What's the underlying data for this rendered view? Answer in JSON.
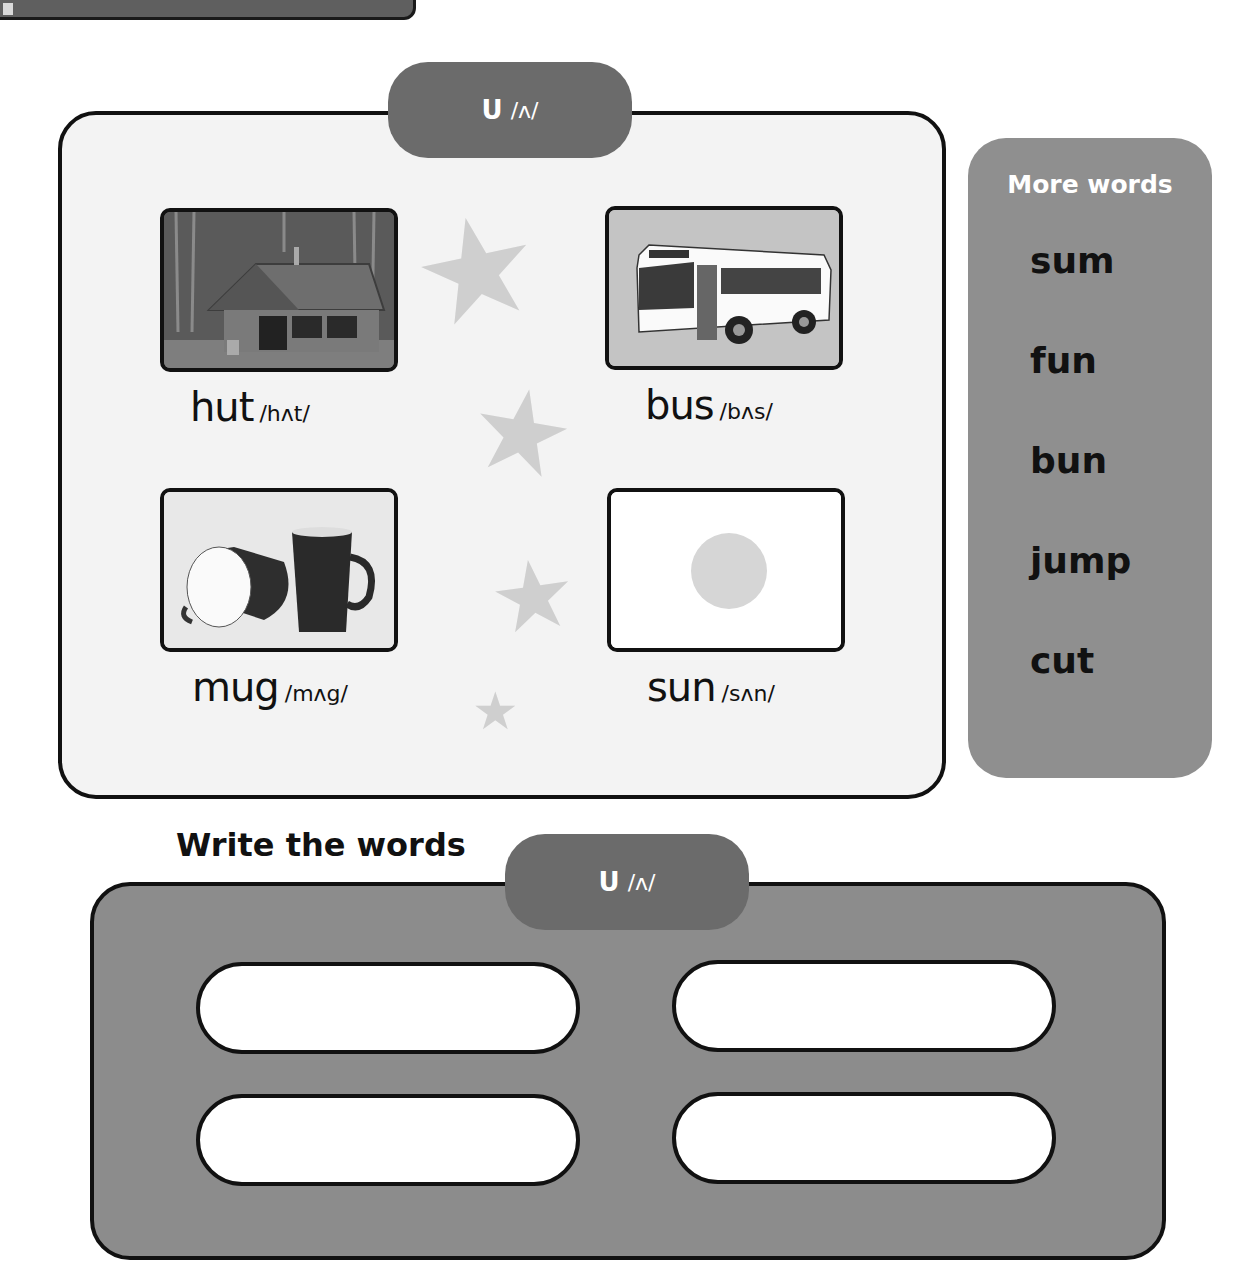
{
  "header": {
    "sound_tab": {
      "letter": "U",
      "ipa": "/ʌ/"
    }
  },
  "cards": [
    {
      "word": "hut",
      "ipa": "/hʌt/",
      "image": "hut-photo"
    },
    {
      "word": "bus",
      "ipa": "/bʌs/",
      "image": "bus-illustration"
    },
    {
      "word": "mug",
      "ipa": "/mʌg/",
      "image": "mugs-photo"
    },
    {
      "word": "sun",
      "ipa": "/sʌn/",
      "image": "sun-illustration"
    }
  ],
  "decorations": {
    "star_glyph": "★"
  },
  "more_words": {
    "title": "More words",
    "items": [
      "sum",
      "fun",
      "bun",
      "jump",
      "cut"
    ]
  },
  "write_section": {
    "title": "Write the words",
    "sound_tab": {
      "letter": "U",
      "ipa": "/ʌ/"
    },
    "answers": [
      {
        "value": "",
        "placeholder": ""
      },
      {
        "value": "",
        "placeholder": ""
      },
      {
        "value": "",
        "placeholder": ""
      },
      {
        "value": "",
        "placeholder": ""
      }
    ]
  },
  "colors": {
    "tab": "#6b6b6b",
    "panel": "#8f8f8f",
    "main_bg": "#f3f3f3",
    "star": "#cfcfcf"
  }
}
